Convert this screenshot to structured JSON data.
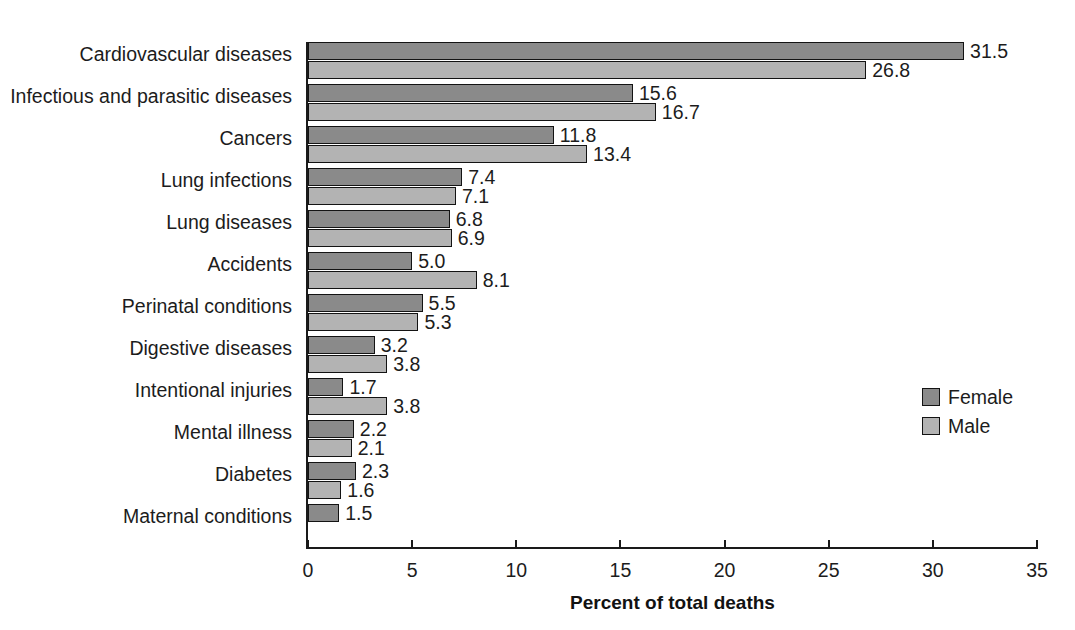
{
  "chart_data": {
    "type": "bar",
    "orientation": "horizontal",
    "title": "",
    "xlabel": "Percent of total deaths",
    "ylabel": "",
    "xlim": [
      0,
      35
    ],
    "xticks": [
      0,
      5,
      10,
      15,
      20,
      25,
      30,
      35
    ],
    "grid": false,
    "legend_position": "right",
    "categories": [
      "Cardiovascular diseases",
      "Infectious and parasitic diseases",
      "Cancers",
      "Lung infections",
      "Lung diseases",
      "Accidents",
      "Perinatal conditions",
      "Digestive diseases",
      "Intentional injuries",
      "Mental illness",
      "Diabetes",
      "Maternal conditions"
    ],
    "series": [
      {
        "name": "Female",
        "color": "#8a8a8a",
        "values": [
          31.5,
          15.6,
          11.8,
          7.4,
          6.8,
          5.0,
          5.5,
          3.2,
          1.7,
          2.2,
          2.3,
          1.5
        ],
        "labels": [
          "31.5",
          "15.6",
          "11.8",
          "7.4",
          "6.8",
          "5.0",
          "5.5",
          "3.2",
          "1.7",
          "2.2",
          "2.3",
          "1.5"
        ]
      },
      {
        "name": "Male",
        "color": "#b3b3b3",
        "values": [
          26.8,
          16.7,
          13.4,
          7.1,
          6.9,
          8.1,
          5.3,
          3.8,
          3.8,
          2.1,
          1.6,
          null
        ],
        "labels": [
          "26.8",
          "16.7",
          "13.4",
          "7.1",
          "6.9",
          "8.1",
          "5.3",
          "3.8",
          "3.8",
          "2.1",
          "1.6",
          ""
        ]
      }
    ]
  },
  "legend": {
    "items": [
      {
        "label": "Female",
        "key": "female"
      },
      {
        "label": "Male",
        "key": "male"
      }
    ]
  },
  "axis": {
    "x_title": "Percent of total deaths",
    "tick_labels": [
      "0",
      "5",
      "10",
      "15",
      "20",
      "25",
      "30",
      "35"
    ]
  }
}
